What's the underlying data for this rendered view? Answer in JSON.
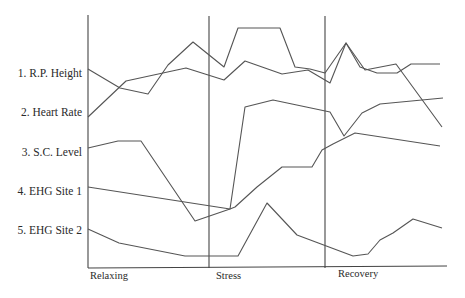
{
  "chart_data": {
    "type": "line",
    "title": "",
    "xlabel": "",
    "ylabel": "",
    "grid": false,
    "legend": "none (series labels on left)",
    "phases": [
      {
        "label": "Relaxing",
        "x_start": 0.0,
        "x_end": 0.34
      },
      {
        "label": "Stress",
        "x_start": 0.34,
        "x_end": 0.66
      },
      {
        "label": "Recovery",
        "x_start": 0.66,
        "x_end": 1.0
      }
    ],
    "series": [
      {
        "name": "1. R.P. Height",
        "points": [
          [
            88,
            69
          ],
          [
            120,
            88
          ],
          [
            148,
            94
          ],
          [
            168,
            65
          ],
          [
            193,
            42
          ],
          [
            224,
            67
          ],
          [
            238,
            28
          ],
          [
            280,
            28
          ],
          [
            295,
            67
          ],
          [
            310,
            69
          ],
          [
            325,
            73
          ],
          [
            346,
            43
          ],
          [
            360,
            67
          ],
          [
            377,
            73
          ],
          [
            397,
            73
          ],
          [
            411,
            64
          ],
          [
            440,
            64
          ]
        ]
      },
      {
        "name": "2. Heart Rate",
        "points": [
          [
            88,
            117
          ],
          [
            126,
            81
          ],
          [
            186,
            68
          ],
          [
            224,
            80
          ],
          [
            245,
            61
          ],
          [
            282,
            74
          ],
          [
            308,
            70
          ],
          [
            330,
            83
          ],
          [
            346,
            43
          ],
          [
            365,
            70
          ],
          [
            396,
            64
          ],
          [
            442,
            127
          ]
        ]
      },
      {
        "name": "3. S.C. Level",
        "points": [
          [
            88,
            148
          ],
          [
            118,
            141
          ],
          [
            141,
            141
          ],
          [
            195,
            221
          ],
          [
            230,
            209
          ],
          [
            245,
            107
          ],
          [
            273,
            100
          ],
          [
            330,
            112
          ],
          [
            344,
            136
          ],
          [
            362,
            113
          ],
          [
            380,
            104
          ],
          [
            443,
            98
          ]
        ]
      },
      {
        "name": "4. EHG Site 1",
        "points": [
          [
            88,
            187
          ],
          [
            230,
            209
          ],
          [
            235,
            207
          ],
          [
            257,
            187
          ],
          [
            282,
            167
          ],
          [
            312,
            167
          ],
          [
            322,
            150
          ],
          [
            333,
            144
          ],
          [
            355,
            133
          ],
          [
            440,
            146
          ]
        ]
      },
      {
        "name": "5. EHG Site 2",
        "points": [
          [
            88,
            229
          ],
          [
            119,
            243
          ],
          [
            185,
            256
          ],
          [
            238,
            256
          ],
          [
            267,
            203
          ],
          [
            297,
            235
          ],
          [
            353,
            256
          ],
          [
            368,
            254
          ],
          [
            380,
            240
          ],
          [
            393,
            233
          ],
          [
            413,
            219
          ],
          [
            442,
            228
          ]
        ]
      }
    ]
  },
  "labels": {
    "series": [
      "1. R.P. Height",
      "2. Heart Rate",
      "3. S.C. Level",
      "4. EHG Site 1",
      "5. EHG Site 2"
    ],
    "phases": [
      "Relaxing",
      "Stress",
      "Recovery"
    ]
  }
}
